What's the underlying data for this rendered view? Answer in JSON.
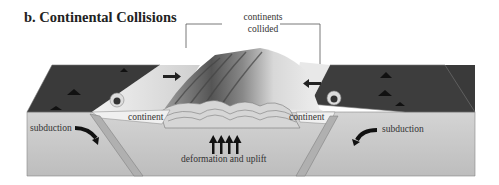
{
  "figure": {
    "title": "b. Continental Collisions",
    "callout": {
      "line1": "continents",
      "line2": "collided"
    },
    "labels": {
      "continent_left": "continent",
      "continent_right": "continent",
      "subduction_left": "subduction",
      "subduction_right": "subduction",
      "deformation": "deformation and uplift"
    }
  },
  "colors": {
    "ocean_surface": "#3c3c3c",
    "crust_side": "#c8c8c8",
    "continent": "#e6e6e6",
    "ink": "#222222"
  }
}
